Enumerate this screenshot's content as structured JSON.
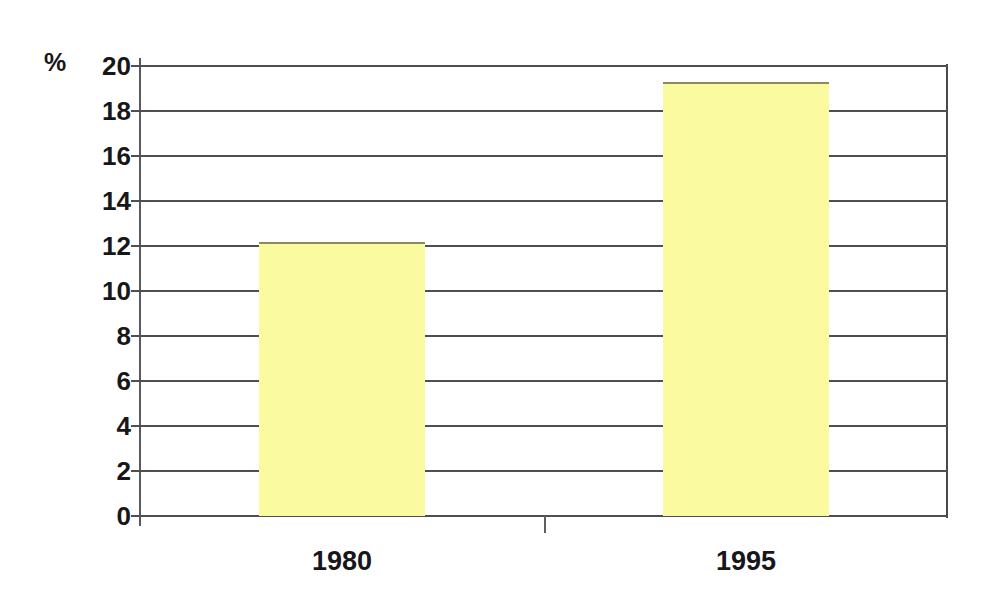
{
  "chart_data": {
    "type": "bar",
    "title": "",
    "subtitle": "",
    "xlabel": "",
    "ylabel": "%",
    "categories": [
      "1980",
      "1995"
    ],
    "values": [
      12.2,
      19.3
    ],
    "series": [
      {
        "name": "",
        "values": [
          12.2,
          19.3
        ]
      }
    ],
    "ylim": [
      0,
      20
    ],
    "yticks": [
      0,
      2,
      4,
      6,
      8,
      10,
      12,
      14,
      16,
      18,
      20
    ],
    "ytick_labels": [
      "0",
      "2",
      "4",
      "6",
      "8",
      "10",
      "12",
      "14",
      "16",
      "18",
      "20"
    ],
    "grid": true,
    "grid_axis": "y",
    "legend": false,
    "legend_position": "none",
    "annotations": [],
    "colors": {
      "bar_fill": "#fafaa0",
      "bar_edge": "#6b6448",
      "gridline": "#4f4f53",
      "axis": "#5a5a5e",
      "text": "#17171a",
      "background": "#ffffff"
    }
  },
  "axis": {
    "unit_symbol": "%"
  }
}
